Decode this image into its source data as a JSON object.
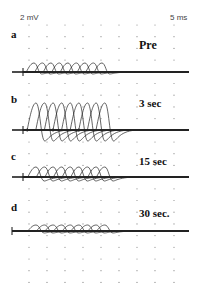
{
  "chart_data": {
    "type": "line",
    "title": "",
    "scale_bar": {
      "voltage": "2 mV",
      "time": "5 ms"
    },
    "grid": {
      "style": "dotted",
      "x_px": [
        29,
        47,
        65,
        83,
        101,
        119,
        137,
        155,
        174
      ],
      "y_start": 25,
      "y_step": 11.7,
      "y_count": 23
    },
    "panels": [
      {
        "letter": "a",
        "label": "Pre",
        "baseline_y": 72,
        "amplitude_px": 9,
        "trough_px": 2,
        "n_traces": 9,
        "first_peak_x": 34,
        "peak_step": 8.5,
        "width_px": 14
      },
      {
        "letter": "b",
        "label": "3 sec",
        "baseline_y": 130,
        "amplitude_px": 27,
        "trough_px": 11,
        "n_traces": 9,
        "first_peak_x": 36,
        "peak_step": 8.6,
        "width_px": 16
      },
      {
        "letter": "c",
        "label": "15 sec",
        "baseline_y": 177,
        "amplitude_px": 10,
        "trough_px": 4,
        "n_traces": 9,
        "first_peak_x": 36,
        "peak_step": 8.6,
        "width_px": 15
      },
      {
        "letter": "d",
        "label": "30 sec",
        "baseline_y": 231,
        "amplitude_px": 6,
        "trough_px": 2,
        "n_traces": 9,
        "first_peak_x": 36,
        "peak_step": 8.6,
        "width_px": 15
      }
    ],
    "xlabel": "",
    "ylabel": ""
  },
  "labels": {
    "voltage_scale": "2 mV",
    "time_scale": "5 ms",
    "panel_a": "a",
    "panel_b": "b",
    "panel_c": "c",
    "panel_d": "d",
    "cond_a": "Pre",
    "cond_b": "3 sec",
    "cond_c": "15 sec",
    "cond_d": "30 sec."
  }
}
